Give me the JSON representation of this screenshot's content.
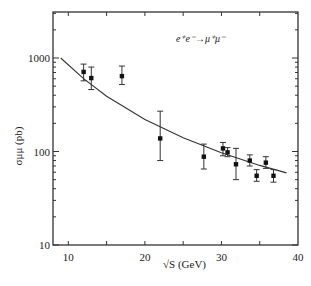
{
  "chart_data": {
    "type": "scatter",
    "title": "",
    "annotation": "e⁺e⁻→μ⁺μ⁻",
    "xlabel": "√S (GeV)",
    "ylabel": "σμμ (pb)",
    "xlim": [
      8,
      40
    ],
    "ylim": [
      10,
      3100
    ],
    "yscale": "log",
    "xticks": [
      10,
      20,
      30,
      40
    ],
    "yticks": [
      10,
      100,
      1000
    ],
    "grid": false,
    "series": [
      {
        "name": "data",
        "kind": "errorbar",
        "points": [
          {
            "x": 12.0,
            "y": 710,
            "ylo": 570,
            "yhi": 860
          },
          {
            "x": 13.0,
            "y": 610,
            "ylo": 460,
            "yhi": 800
          },
          {
            "x": 17.0,
            "y": 640,
            "ylo": 520,
            "yhi": 820
          },
          {
            "x": 22.0,
            "y": 138,
            "ylo": 80,
            "yhi": 270
          },
          {
            "x": 27.7,
            "y": 88,
            "ylo": 65,
            "yhi": 120
          },
          {
            "x": 30.2,
            "y": 108,
            "ylo": 90,
            "yhi": 125
          },
          {
            "x": 30.8,
            "y": 98,
            "ylo": 88,
            "yhi": 110
          },
          {
            "x": 31.9,
            "y": 73,
            "ylo": 50,
            "yhi": 108
          },
          {
            "x": 33.7,
            "y": 80,
            "ylo": 70,
            "yhi": 92
          },
          {
            "x": 34.6,
            "y": 55,
            "ylo": 48,
            "yhi": 64
          },
          {
            "x": 35.8,
            "y": 76,
            "ylo": 66,
            "yhi": 88
          },
          {
            "x": 36.8,
            "y": 55,
            "ylo": 47,
            "yhi": 64
          }
        ]
      },
      {
        "name": "QED prediction",
        "kind": "line",
        "x": [
          9,
          12,
          15,
          20,
          25,
          30,
          35,
          38.5
        ],
        "y": [
          1000,
          600,
          390,
          220,
          140,
          97,
          71,
          59
        ]
      }
    ]
  }
}
